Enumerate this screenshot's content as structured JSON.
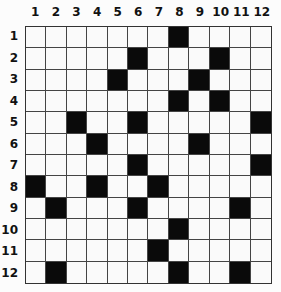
{
  "puzzle": {
    "rows": 12,
    "cols": 12,
    "column_labels": [
      "1",
      "2",
      "3",
      "4",
      "5",
      "6",
      "7",
      "8",
      "9",
      "10",
      "11",
      "12"
    ],
    "row_labels": [
      "1",
      "2",
      "3",
      "4",
      "5",
      "6",
      "7",
      "8",
      "9",
      "10",
      "11",
      "12"
    ],
    "black_cells": {
      "1": [
        8
      ],
      "2": [
        6,
        10
      ],
      "3": [
        5,
        9
      ],
      "4": [
        8,
        10
      ],
      "5": [
        3,
        6,
        12
      ],
      "6": [
        4,
        9
      ],
      "7": [
        6,
        12
      ],
      "8": [
        1,
        4,
        7
      ],
      "9": [
        2,
        6,
        11
      ],
      "10": [
        8
      ],
      "11": [
        7
      ],
      "12": [
        2,
        8,
        11
      ]
    },
    "colors": {
      "black": "#0a0a0a",
      "white": "#fafafa",
      "grid_line": "#444444"
    }
  }
}
